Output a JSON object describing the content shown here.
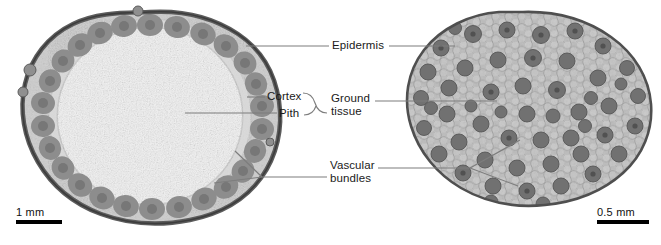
{
  "figure": {
    "background": "#ffffff",
    "leader_color": "#7d7d7d",
    "text_color": "#1a1a1a"
  },
  "labels": [
    {
      "id": "epidermis",
      "text": "Epidermis",
      "x": 332,
      "y": 40
    },
    {
      "id": "cortex",
      "text": "Cortex",
      "x": 268,
      "y": 93
    },
    {
      "id": "pith",
      "text": "Pith",
      "x": 280,
      "y": 111
    },
    {
      "id": "ground-tissue",
      "line1": "Ground",
      "line2": "tissue",
      "x": 333,
      "y": 94
    },
    {
      "id": "vascular-bundles",
      "line1": "Vascular",
      "line2": "bundles",
      "x": 331,
      "y": 160
    }
  ],
  "specimens": [
    {
      "id": "dicot-stem",
      "position": "left",
      "tissue_fill": "#cfcfcf",
      "pith_fill": "#f0f0f0",
      "bundle_fill": "#8a8a8a",
      "epidermis_stroke": "#5a5a5a",
      "bundle_count": 26,
      "arrangement": "ring",
      "scalebar": {
        "text": "1 mm",
        "x": 16,
        "y": 208,
        "bar_width": 46
      }
    },
    {
      "id": "monocot-stem",
      "position": "right",
      "tissue_fill": "#b9b9b9",
      "pith_fill": "#bdbdbd",
      "bundle_fill": "#6e6e6e",
      "epidermis_stroke": "#4f4f4f",
      "bundle_count": 62,
      "arrangement": "scattered",
      "scalebar": {
        "text": "0.5 mm",
        "x": 597,
        "y": 208,
        "bar_width": 52
      }
    }
  ]
}
